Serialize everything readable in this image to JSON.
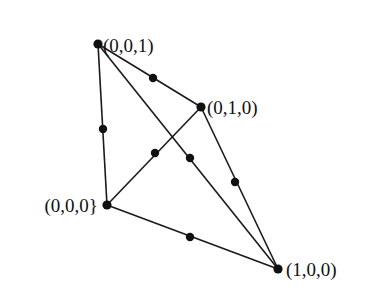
{
  "diagram": {
    "type": "simplex-with-edge-midpoints",
    "vertices": [
      {
        "id": "v001",
        "label": "(0,0,1)",
        "x": 98,
        "y": 44,
        "label_x": 103,
        "label_y": 52,
        "anchor": "start"
      },
      {
        "id": "v010",
        "label": "(0,1,0)",
        "x": 201,
        "y": 107,
        "label_x": 207,
        "label_y": 114,
        "anchor": "start"
      },
      {
        "id": "v000",
        "label": "(0,0,0}",
        "x": 107,
        "y": 205,
        "label_x": 98,
        "label_y": 212,
        "anchor": "end"
      },
      {
        "id": "v100",
        "label": "(1,0,0)",
        "x": 278,
        "y": 269,
        "label_x": 286,
        "label_y": 276,
        "anchor": "start"
      }
    ],
    "edges": [
      {
        "from": "v001",
        "to": "v010",
        "midpoint": [
          153,
          78
        ]
      },
      {
        "from": "v001",
        "to": "v000",
        "midpoint": [
          103,
          129
        ]
      },
      {
        "from": "v001",
        "to": "v100",
        "midpoint": [
          190,
          158
        ]
      },
      {
        "from": "v000",
        "to": "v010",
        "midpoint": [
          155,
          153
        ]
      },
      {
        "from": "v010",
        "to": "v100",
        "midpoint": [
          235,
          182
        ]
      },
      {
        "from": "v000",
        "to": "v100",
        "midpoint": [
          190,
          237
        ]
      }
    ],
    "colors": {
      "line": "#1a1a1a",
      "point": "#111111",
      "background": "#ffffff"
    }
  }
}
